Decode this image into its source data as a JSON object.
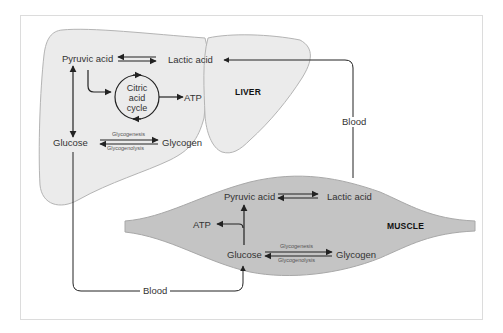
{
  "colors": {
    "liver_fill": "#ebebeb",
    "liver_stroke": "#b4b4b4",
    "muscle_fill": "#c4c4c4",
    "muscle_stroke": "#a8a8a8",
    "arrow": "#222222",
    "frame": "#dcdcdc",
    "text": "#333333"
  },
  "liver": {
    "label": "LIVER",
    "pyruvic_acid": "Pyruvic acid",
    "lactic_acid": "Lactic acid",
    "citric_acid_cycle": [
      "Citric",
      "acid",
      "cycle"
    ],
    "atp": "ATP",
    "glucose": "Glucose",
    "glycogen": "Glycogen",
    "glycogenesis": "Glycogenesis",
    "glycogenolysis": "Glycogenolysis"
  },
  "muscle": {
    "label": "MUSCLE",
    "pyruvic_acid": "Pyruvic acid",
    "lactic_acid": "Lactic acid",
    "atp": "ATP",
    "glucose": "Glucose",
    "glycogen": "Glycogen",
    "glycogenesis": "Glycogenesis",
    "glycogenolysis": "Glycogenolysis"
  },
  "blood_paths": {
    "right_label": "Blood",
    "bottom_label": "Blood"
  }
}
